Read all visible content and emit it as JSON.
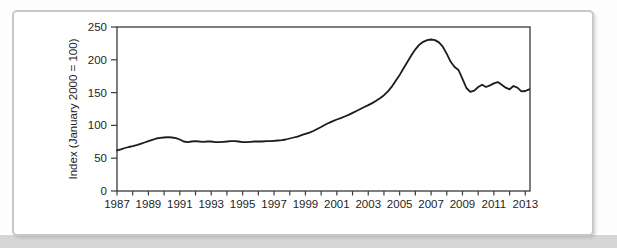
{
  "figure": {
    "y_axis_title": "Index (January 2000 = 100)"
  },
  "colors": {
    "line": "#1c1c1c",
    "axis": "#3a3a3a",
    "tick_text": "#1e1e1e",
    "card_border": "#c6c9c7",
    "card_background": "#ffffff",
    "page_strip": "#d6d6d6"
  },
  "chart_data": {
    "type": "line",
    "title": "",
    "xlabel": "",
    "ylabel": "Index (January 2000 = 100)",
    "xlim": [
      1987,
      2013.3
    ],
    "ylim": [
      0,
      250
    ],
    "grid": false,
    "legend": false,
    "x_tick_labels": [
      "1987",
      "1989",
      "1991",
      "1993",
      "1995",
      "1997",
      "1999",
      "2001",
      "2003",
      "2005",
      "2007",
      "2009",
      "2011",
      "2013"
    ],
    "x_labeled_tick_years": [
      1987,
      1989,
      1991,
      1993,
      1995,
      1997,
      1999,
      2001,
      2003,
      2005,
      2007,
      2009,
      2011,
      2013
    ],
    "x_minor_tick_step": 1,
    "y_ticks": [
      0,
      50,
      100,
      150,
      200,
      250
    ],
    "series": [
      {
        "name": "House price index",
        "points": [
          [
            1987.0,
            62
          ],
          [
            1987.25,
            63.5
          ],
          [
            1987.5,
            65.5
          ],
          [
            1987.75,
            67
          ],
          [
            1988.0,
            68.5
          ],
          [
            1988.25,
            70
          ],
          [
            1988.5,
            72
          ],
          [
            1988.75,
            74
          ],
          [
            1989.0,
            76
          ],
          [
            1989.25,
            78
          ],
          [
            1989.5,
            80
          ],
          [
            1989.75,
            81
          ],
          [
            1990.0,
            81.5
          ],
          [
            1990.25,
            82
          ],
          [
            1990.5,
            81.5
          ],
          [
            1990.75,
            80.5
          ],
          [
            1991.0,
            78.5
          ],
          [
            1991.25,
            75.5
          ],
          [
            1991.5,
            74.5
          ],
          [
            1991.75,
            75.5
          ],
          [
            1992.0,
            76
          ],
          [
            1992.25,
            75.5
          ],
          [
            1992.5,
            75
          ],
          [
            1992.75,
            75.5
          ],
          [
            1993.0,
            75.5
          ],
          [
            1993.25,
            74.5
          ],
          [
            1993.5,
            74.5
          ],
          [
            1993.75,
            75
          ],
          [
            1994.0,
            75.5
          ],
          [
            1994.25,
            76
          ],
          [
            1994.5,
            76
          ],
          [
            1994.75,
            75.5
          ],
          [
            1995.0,
            74.5
          ],
          [
            1995.25,
            74.5
          ],
          [
            1995.5,
            75
          ],
          [
            1995.75,
            75.5
          ],
          [
            1996.0,
            75.5
          ],
          [
            1996.25,
            75.5
          ],
          [
            1996.5,
            76
          ],
          [
            1996.75,
            76
          ],
          [
            1997.0,
            76.5
          ],
          [
            1997.25,
            77
          ],
          [
            1997.5,
            77.5
          ],
          [
            1997.75,
            78.5
          ],
          [
            1998.0,
            80
          ],
          [
            1998.25,
            81.5
          ],
          [
            1998.5,
            83
          ],
          [
            1998.75,
            85
          ],
          [
            1999.0,
            87
          ],
          [
            1999.25,
            89
          ],
          [
            1999.5,
            91.5
          ],
          [
            1999.75,
            94.5
          ],
          [
            2000.0,
            97.5
          ],
          [
            2000.25,
            101
          ],
          [
            2000.5,
            104
          ],
          [
            2000.75,
            106.5
          ],
          [
            2001.0,
            109
          ],
          [
            2001.25,
            111
          ],
          [
            2001.5,
            113.5
          ],
          [
            2001.75,
            116
          ],
          [
            2002.0,
            119
          ],
          [
            2002.25,
            122
          ],
          [
            2002.5,
            125
          ],
          [
            2002.75,
            128
          ],
          [
            2003.0,
            131
          ],
          [
            2003.25,
            134
          ],
          [
            2003.5,
            137.5
          ],
          [
            2003.75,
            141.5
          ],
          [
            2004.0,
            146
          ],
          [
            2004.25,
            152
          ],
          [
            2004.5,
            159
          ],
          [
            2004.75,
            168
          ],
          [
            2005.0,
            177
          ],
          [
            2005.25,
            187
          ],
          [
            2005.5,
            197
          ],
          [
            2005.75,
            207
          ],
          [
            2006.0,
            216
          ],
          [
            2006.25,
            223
          ],
          [
            2006.5,
            227.5
          ],
          [
            2006.75,
            230
          ],
          [
            2007.0,
            231
          ],
          [
            2007.25,
            230
          ],
          [
            2007.5,
            226.5
          ],
          [
            2007.75,
            220
          ],
          [
            2008.0,
            209
          ],
          [
            2008.25,
            197
          ],
          [
            2008.5,
            189
          ],
          [
            2008.75,
            184.5
          ],
          [
            2009.0,
            171
          ],
          [
            2009.25,
            157
          ],
          [
            2009.5,
            151
          ],
          [
            2009.75,
            153
          ],
          [
            2010.0,
            158.5
          ],
          [
            2010.25,
            162
          ],
          [
            2010.5,
            158.5
          ],
          [
            2010.75,
            161
          ],
          [
            2011.0,
            164
          ],
          [
            2011.25,
            166
          ],
          [
            2011.5,
            162
          ],
          [
            2011.75,
            157.5
          ],
          [
            2012.0,
            155
          ],
          [
            2012.25,
            160
          ],
          [
            2012.5,
            157.5
          ],
          [
            2012.75,
            152
          ],
          [
            2013.0,
            152.5
          ],
          [
            2013.25,
            155
          ]
        ]
      }
    ]
  }
}
